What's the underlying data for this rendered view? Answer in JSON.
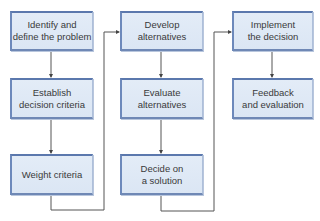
{
  "diagram": {
    "colors": {
      "box_fill": "#dde8f5",
      "box_border": "#5b78ad",
      "line": "#555555",
      "text": "#3a3a3a"
    },
    "columns": [
      {
        "steps": [
          {
            "label": "Identify and\ndefine the problem"
          },
          {
            "label": "Establish\ndecision criteria"
          },
          {
            "label": "Weight criteria"
          }
        ]
      },
      {
        "steps": [
          {
            "label": "Develop\nalternatives"
          },
          {
            "label": "Evaluate\nalternatives"
          },
          {
            "label": "Decide on\na solution"
          }
        ]
      },
      {
        "steps": [
          {
            "label": "Implement\nthe decision"
          },
          {
            "label": "Feedback\nand evaluation"
          }
        ]
      }
    ]
  }
}
